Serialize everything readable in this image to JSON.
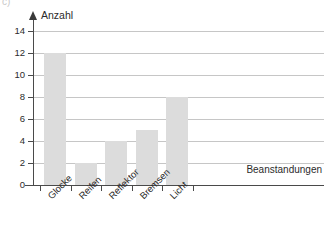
{
  "item_marker": "c)",
  "chart_data": {
    "type": "bar",
    "title": "",
    "categories": [
      "Glocke",
      "Reifen",
      "Reflektor",
      "Bremsen",
      "Licht"
    ],
    "values": [
      12,
      2,
      4,
      5,
      8
    ],
    "xlabel": "Beanstandungen",
    "ylabel": "Anzahl",
    "ylim": [
      0,
      14
    ],
    "yticks": [
      0,
      2,
      4,
      6,
      8,
      10,
      12,
      14
    ],
    "ytick_labels": [
      "0",
      "2",
      "4",
      "6",
      "8",
      "10",
      "12",
      "14"
    ],
    "grid": true,
    "legend": "none",
    "bar_color": "#dcdcdc",
    "axis_color": "#4a4a4a",
    "grid_color": "#c6c6c6"
  }
}
